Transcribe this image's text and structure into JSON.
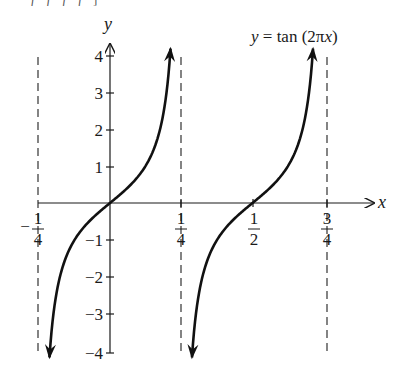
{
  "chart_data": {
    "type": "line",
    "title": "y = tan (2πx)",
    "xlabel": "x",
    "ylabel": "y",
    "function": "tan(2*pi*x)",
    "xlim": [
      -0.25,
      0.75
    ],
    "ylim": [
      -4,
      4
    ],
    "x_ticks": [
      {
        "value": -0.25,
        "num": "1",
        "den": "4",
        "sign": "−"
      },
      {
        "value": 0.25,
        "num": "1",
        "den": "4",
        "sign": ""
      },
      {
        "value": 0.5,
        "num": "1",
        "den": "2",
        "sign": ""
      },
      {
        "value": 0.75,
        "num": "3",
        "den": "4",
        "sign": ""
      }
    ],
    "y_ticks": [
      "4",
      "3",
      "2",
      "1",
      "−1",
      "−2",
      "−3",
      "−4"
    ],
    "y_tick_values": [
      4,
      3,
      2,
      1,
      -1,
      -2,
      -3,
      -4
    ],
    "asymptotes": [
      -0.25,
      0.25,
      0.75
    ],
    "series": [
      {
        "name": "branch 1",
        "x": [
          -0.235,
          -0.2,
          -0.15,
          -0.1,
          -0.05,
          0,
          0.05,
          0.1,
          0.15,
          0.2,
          0.235
        ],
        "y": [
          -4.2,
          -1.38,
          -0.73,
          -0.32,
          0.32,
          0,
          0.32,
          0.73,
          1.38,
          3.08,
          4.2
        ]
      },
      {
        "name": "branch 2",
        "x": [
          0.265,
          0.3,
          0.35,
          0.4,
          0.45,
          0.5,
          0.55,
          0.6,
          0.65,
          0.7,
          0.735
        ],
        "y": [
          -4.2,
          -3.08,
          -1.38,
          -0.73,
          -0.32,
          0,
          0.32,
          0.73,
          1.38,
          3.08,
          4.2
        ]
      }
    ],
    "grid": false,
    "legend": "none"
  },
  "labels": {
    "equation_lhs": "y",
    "equation_rest": " = tan (2π",
    "equation_x": "x",
    "equation_close": ")",
    "x_axis": "x",
    "y_axis": "y",
    "top_cut_text": "ƒ ƒ ƒ ƒ ]"
  }
}
